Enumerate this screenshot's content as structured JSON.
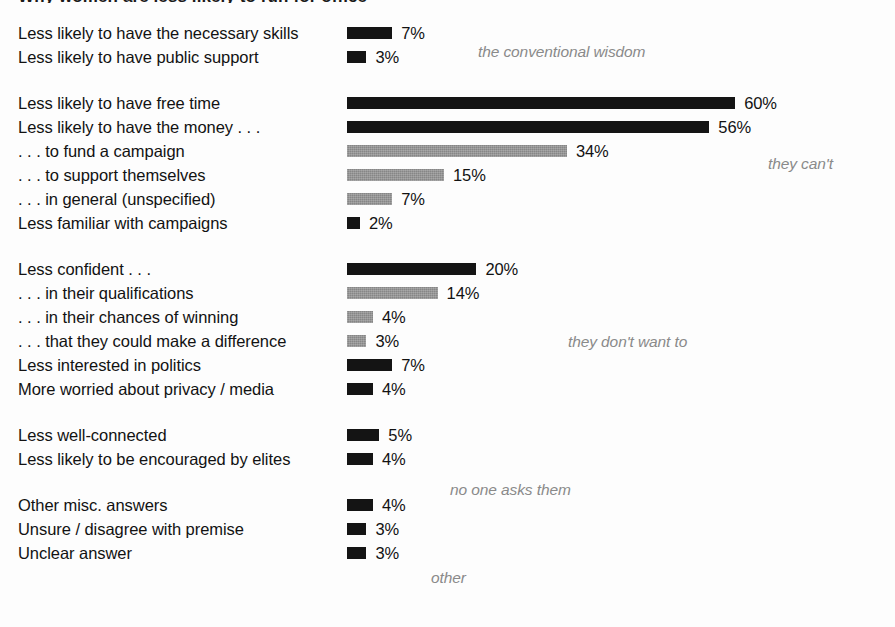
{
  "figure": {
    "title_remnant": "Why women are less likely to run for office",
    "width": 895,
    "height": 627,
    "px_per_percent": 6.47,
    "bar_origin_x": 347,
    "colors": {
      "dark_bar": "#141414",
      "gray_bar": "#868686",
      "label_text": "#121212",
      "annotation_text": "#8a8a8a",
      "background": "#fdfdfd"
    }
  },
  "chart_data": {
    "type": "bar",
    "orientation": "horizontal",
    "title": "Why women are less likely to run for office",
    "xlabel": "",
    "ylabel": "",
    "xlim": [
      0,
      60
    ],
    "grid": false,
    "value_suffix": "%",
    "legend": [],
    "series_note": "Two bar shades used: dark (#141414) and gray (#868686). Gray marks money/confidence sub-items and their parent-level items in the can't/don't-want clusters.",
    "categories": [
      "Less likely to have the necessary skills",
      "Less likely to have public support",
      "Less likely to have free time",
      "Less likely to have the money . . .",
      ". . . to fund a campaign",
      ". . . to support themselves",
      ". . . in general (unspecified)",
      "Less familiar with campaigns",
      "Less confident . . .",
      ". . . in their qualifications",
      ". . . in their chances of winning",
      ". . . that they could make a difference",
      "Less interested in politics",
      "More worried about privacy / media",
      "Less well-connected",
      "Less likely to be encouraged by elites",
      "Other misc. answers",
      "Unsure / disagree with premise",
      "Unclear answer"
    ],
    "values": [
      7,
      3,
      60,
      56,
      34,
      15,
      7,
      2,
      20,
      14,
      4,
      3,
      7,
      4,
      5,
      4,
      4,
      3,
      3
    ],
    "annotations": [
      "the conventional wisdom",
      "they can't",
      "they don't want to",
      "no one asks them",
      "other"
    ]
  },
  "groups": [
    {
      "id": "conventional-wisdom",
      "annotation": {
        "text": "the conventional wisdom",
        "x": 478,
        "y": 43
      },
      "rows": [
        {
          "label": "Less likely to have the necessary skills",
          "value": 7,
          "value_label": "7%",
          "shade": "dark"
        },
        {
          "label": "Less likely to have public support",
          "value": 3,
          "value_label": "3%",
          "shade": "dark"
        }
      ]
    },
    {
      "id": "they-cant",
      "annotation": {
        "text": "they can't",
        "x": 768,
        "y": 155
      },
      "rows": [
        {
          "label": "Less likely to have free time",
          "value": 60,
          "value_label": "60%",
          "shade": "dark"
        },
        {
          "label": "Less likely to have the money . . .",
          "value": 56,
          "value_label": "56%",
          "shade": "dark"
        },
        {
          "label": ". . . to fund a campaign",
          "value": 34,
          "value_label": "34%",
          "shade": "gray"
        },
        {
          "label": ". . . to support themselves",
          "value": 15,
          "value_label": "15%",
          "shade": "gray"
        },
        {
          "label": ". . . in general (unspecified)",
          "value": 7,
          "value_label": "7%",
          "shade": "gray"
        },
        {
          "label": "Less familiar with campaigns",
          "value": 2,
          "value_label": "2%",
          "shade": "dark"
        }
      ]
    },
    {
      "id": "they-dont-want-to",
      "annotation": {
        "text": "they don't want to",
        "x": 568,
        "y": 333
      },
      "rows": [
        {
          "label": "Less confident . . .",
          "value": 20,
          "value_label": "20%",
          "shade": "dark"
        },
        {
          "label": ". . . in their qualifications",
          "value": 14,
          "value_label": "14%",
          "shade": "gray"
        },
        {
          "label": ". . . in their chances of winning",
          "value": 4,
          "value_label": "4%",
          "shade": "gray"
        },
        {
          "label": ". . . that they could make a difference",
          "value": 3,
          "value_label": "3%",
          "shade": "gray"
        },
        {
          "label": "Less interested in politics",
          "value": 7,
          "value_label": "7%",
          "shade": "dark"
        },
        {
          "label": "More worried about privacy / media",
          "value": 4,
          "value_label": "4%",
          "shade": "dark"
        }
      ]
    },
    {
      "id": "no-one-asks-them",
      "annotation": {
        "text": "no one asks them",
        "x": 450,
        "y": 481
      },
      "rows": [
        {
          "label": "Less well-connected",
          "value": 5,
          "value_label": "5%",
          "shade": "dark"
        },
        {
          "label": "Less likely to be encouraged by elites",
          "value": 4,
          "value_label": "4%",
          "shade": "dark"
        }
      ]
    },
    {
      "id": "other",
      "annotation": {
        "text": "other",
        "x": 431,
        "y": 569
      },
      "rows": [
        {
          "label": "Other misc. answers",
          "value": 4,
          "value_label": "4%",
          "shade": "dark"
        },
        {
          "label": "Unsure / disagree with premise",
          "value": 3,
          "value_label": "3%",
          "shade": "dark"
        },
        {
          "label": "Unclear answer",
          "value": 3,
          "value_label": "3%",
          "shade": "dark"
        }
      ]
    }
  ]
}
